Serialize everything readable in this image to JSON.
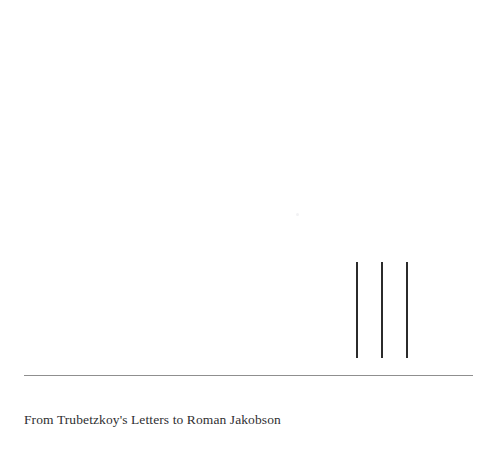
{
  "page": {
    "background_color": "#ffffff",
    "width": 497,
    "height": 454
  },
  "figure": {
    "name": "three-vertical-strokes",
    "stroke_color": "#2b2b2b",
    "strokes": [
      {
        "label": "stroke-1",
        "x": 356,
        "y_top": 262,
        "y_bottom": 358,
        "width": 2
      },
      {
        "label": "stroke-2",
        "x": 381,
        "y_top": 262,
        "y_bottom": 358,
        "width": 2
      },
      {
        "label": "stroke-3",
        "x": 406,
        "y_top": 262,
        "y_bottom": 358,
        "width": 2
      }
    ],
    "artifact": {
      "label": "faint-speck",
      "x": 296,
      "y": 213,
      "color": "#f2f2f4"
    }
  },
  "divider": {
    "color": "#8f8f8f",
    "x_start": 24,
    "x_end": 473,
    "y": 375
  },
  "caption": {
    "text": "From Trubetzkoy's Letters to Roman Jakobson",
    "color": "#2f2f31"
  }
}
